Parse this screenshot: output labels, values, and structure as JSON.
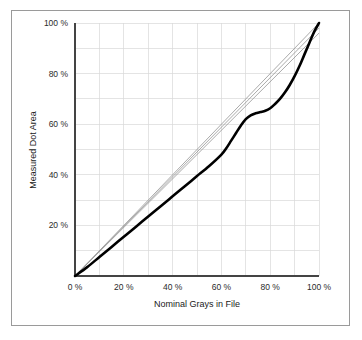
{
  "figure": {
    "border_color": "#9a9a9a",
    "background": "#ffffff"
  },
  "chart_data": {
    "type": "line",
    "title": "",
    "xlabel": "Nominal Grays in File",
    "ylabel": "Measured Dot Area",
    "xlim": [
      0,
      100
    ],
    "ylim": [
      0,
      100
    ],
    "grid": true,
    "legend_position": "none",
    "x_ticks": [
      0,
      20,
      40,
      60,
      80,
      100
    ],
    "y_ticks": [
      0,
      20,
      40,
      60,
      80,
      100
    ],
    "x_tick_labels": [
      "0 %",
      "20 %",
      "40 %",
      "60 %",
      "80 %",
      "100 %"
    ],
    "y_tick_labels": [
      "0 %",
      "20 %",
      "40 %",
      "60 %",
      "80 %",
      "100 %"
    ],
    "x_minor_gridlines": [
      10,
      30,
      50,
      70,
      90
    ],
    "y_minor_gridlines": [
      10,
      30,
      50,
      70,
      90
    ],
    "series": [
      {
        "name": "reference-line-upper",
        "style": "thin-gray",
        "color": "#8e8e8e",
        "x": [
          0,
          100
        ],
        "values": [
          0,
          100
        ]
      },
      {
        "name": "reference-line-middle",
        "style": "thin-gray",
        "color": "#8e8e8e",
        "x": [
          0,
          100
        ],
        "values": [
          0,
          98
        ]
      },
      {
        "name": "reference-line-lower",
        "style": "thin-gray",
        "color": "#8e8e8e",
        "x": [
          0,
          100
        ],
        "values": [
          0,
          96
        ]
      },
      {
        "name": "measured-dot-area-curve",
        "style": "thick-black",
        "color": "#000000",
        "x": [
          0,
          5,
          10,
          15,
          20,
          25,
          30,
          35,
          40,
          45,
          50,
          55,
          60,
          62,
          64,
          66,
          68,
          70,
          72,
          74,
          76,
          78,
          80,
          82,
          84,
          86,
          88,
          90,
          92,
          94,
          96,
          98,
          100
        ],
        "values": [
          0,
          3.5,
          7.5,
          11.5,
          15.5,
          19.5,
          23.5,
          27.5,
          31.5,
          35.5,
          39.5,
          43.5,
          48.0,
          50.5,
          53.5,
          56.5,
          59.5,
          62.0,
          63.5,
          64.3,
          64.8,
          65.3,
          66.3,
          68.0,
          70.0,
          72.5,
          75.5,
          79.0,
          83.0,
          87.5,
          92.0,
          96.5,
          100
        ]
      }
    ]
  }
}
